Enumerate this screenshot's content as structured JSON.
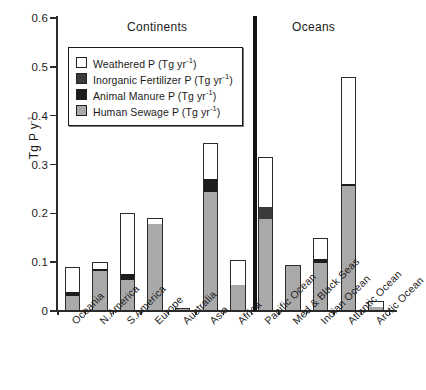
{
  "chart_data": {
    "type": "bar",
    "title": "",
    "xlabel": "",
    "ylabel": "Tg P y",
    "ylabel_sup": "-1",
    "ylim": [
      0,
      0.6
    ],
    "yticks": [
      "0",
      "0.1",
      "0.2",
      "0.3",
      "0.4",
      "0.5",
      "0.6"
    ],
    "ytick_values": [
      0,
      0.1,
      0.2,
      0.3,
      0.4,
      0.5,
      0.6
    ],
    "grid": false,
    "legend_position": "upper-left-inside",
    "stacked": true,
    "group_labels": [
      "Continents",
      "Oceans"
    ],
    "series": [
      {
        "name": "Human Sewage P (Tg yr-1)",
        "color": "#a9a9a9",
        "values": [
          0.03,
          0.082,
          0.064,
          0.178,
          0.004,
          0.243,
          0.053,
          0.188,
          0.094,
          0.099,
          0.255,
          0.009
        ]
      },
      {
        "name": "Animal Manure P (Tg yr-1)",
        "color": "#1c1c1c",
        "values": [
          0.008,
          0.005,
          0.012,
          0.0,
          0.0,
          0.028,
          0.0,
          0.0,
          0.0,
          0.008,
          0.006,
          0.0
        ]
      },
      {
        "name": "Inorganic Fertilizer P (Tg yr-1)",
        "color": "#3a3a3a",
        "values": [
          0.0,
          0.0,
          0.0,
          0.0,
          0.0,
          0.0,
          0.0,
          0.026,
          0.0,
          0.0,
          0.0,
          0.0
        ]
      },
      {
        "name": "Weathered P (Tg yr-1)",
        "color": "#ffffff",
        "values": [
          0.052,
          0.013,
          0.124,
          0.012,
          0.001,
          0.074,
          0.052,
          0.101,
          0.0,
          0.043,
          0.219,
          0.011
        ]
      }
    ],
    "categories": [
      "Oceania",
      "N.America",
      "S.America",
      "Europe",
      "Australia",
      "Asia",
      "Africa",
      "Pacific Ocean",
      "Med & Black Seas",
      "Indian Ocean",
      "Atlantic Ocean",
      "Arctic Ocean"
    ],
    "totals": [
      0.09,
      0.1,
      0.2,
      0.19,
      0.005,
      0.345,
      0.105,
      0.315,
      0.094,
      0.15,
      0.48,
      0.02
    ]
  },
  "legend": {
    "items": [
      {
        "label": "Weathered P (Tg yr",
        "sup": "-1",
        "tail": ")",
        "color": "#ffffff"
      },
      {
        "label": "Inorganic Fertilizer P (Tg yr",
        "sup": "-1",
        "tail": ")",
        "color": "#3a3a3a"
      },
      {
        "label": "Animal Manure P (Tg yr",
        "sup": "-1",
        "tail": ")",
        "color": "#1c1c1c"
      },
      {
        "label": "Human Sewage P (Tg yr",
        "sup": "-1",
        "tail": ")",
        "color": "#a9a9a9"
      }
    ]
  },
  "sections": {
    "continents": "Continents",
    "oceans": "Oceans"
  }
}
